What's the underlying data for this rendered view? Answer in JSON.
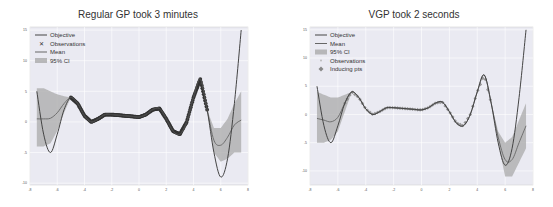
{
  "figure": {
    "left_title": "Regular GP took 3 minutes",
    "right_title": "VGP took 2 seconds"
  },
  "colors": {
    "background": "#eaeaf2",
    "grid": "#ffffff",
    "objective": "#444444",
    "mean": "#666666",
    "ci": "#aaaaaa",
    "observations": "#333333",
    "inducing": "#888888"
  },
  "chart_data": [
    {
      "type": "line",
      "title": "Regular GP took 3 minutes",
      "xlabel": "",
      "ylabel": "",
      "xlim": [
        -8,
        8
      ],
      "ylim": [
        -10,
        15
      ],
      "x_ticks": [
        "-8",
        "-6",
        "-4",
        "-2",
        "0",
        "2",
        "4",
        "6",
        "8"
      ],
      "y_ticks": [
        "15",
        "10",
        "5",
        "0",
        "-5",
        "-10"
      ],
      "grid": true,
      "legend_position": "upper left",
      "legend": [
        "Objective",
        "Observations",
        "Mean",
        "95% CI"
      ],
      "series": [
        {
          "name": "Objective",
          "x": [
            -7.5,
            -7,
            -6.5,
            -6,
            -5.5,
            -5,
            -4.5,
            -4,
            -3.5,
            -3,
            -2.5,
            -2,
            -1.5,
            -1,
            -0.5,
            0,
            0.5,
            1,
            1.5,
            2,
            2.5,
            3,
            3.5,
            4,
            4.5,
            5,
            5.5,
            6,
            6.5,
            7,
            7.5
          ],
          "values": [
            5,
            -2,
            -5,
            -2,
            2,
            4,
            3,
            1,
            0,
            0.5,
            1.2,
            1.2,
            1.1,
            1.0,
            0.9,
            0.8,
            1.2,
            2,
            2.2,
            0.5,
            -1.5,
            -2,
            0,
            4,
            7,
            2,
            -5,
            -9,
            -6,
            3,
            15
          ]
        },
        {
          "name": "Mean",
          "x": [
            -7.5,
            -7,
            -6.5,
            -6,
            -5.5,
            -5,
            -4.5,
            -4,
            -3.5,
            -3,
            -2.5,
            -2,
            -1.5,
            -1,
            -0.5,
            0,
            0.5,
            1,
            1.5,
            2,
            2.5,
            3,
            3.5,
            4,
            4.5,
            5,
            5.5,
            6,
            6.5,
            7,
            7.5
          ],
          "values": [
            0.5,
            0.5,
            0.6,
            1.5,
            3,
            4,
            3,
            1,
            0,
            0.5,
            1.2,
            1.2,
            1.1,
            1.0,
            0.9,
            0.8,
            1.2,
            2,
            2.2,
            0.5,
            -1.5,
            -2,
            0,
            4,
            7,
            2,
            -3,
            -3.8,
            -2.5,
            -0.5,
            0.3
          ]
        },
        {
          "name": "95% CI upper",
          "x": [
            -7.5,
            -7,
            -6.5,
            -6,
            -5.5,
            -5,
            5,
            5.5,
            6,
            6.5,
            7,
            7.5
          ],
          "values": [
            5.5,
            5.5,
            5,
            4.5,
            4.2,
            4,
            2,
            -1,
            -1,
            0.5,
            3,
            5
          ]
        },
        {
          "name": "95% CI lower",
          "x": [
            -7.5,
            -7,
            -6.5,
            -6,
            -5.5,
            -5,
            5,
            5.5,
            6,
            6.5,
            7,
            7.5
          ],
          "values": [
            -4,
            -4,
            -3.5,
            -1.5,
            1.5,
            4,
            2,
            -5,
            -6.5,
            -6,
            -5,
            -5
          ]
        },
        {
          "name": "Observations",
          "x_range": [
            -5,
            5
          ],
          "note": "dense observations along objective"
        }
      ]
    },
    {
      "type": "line",
      "title": "VGP took 2 seconds",
      "xlabel": "",
      "ylabel": "",
      "xlim": [
        -8,
        8
      ],
      "ylim": [
        -12,
        15
      ],
      "x_ticks": [
        "-8",
        "-6",
        "-4",
        "-2",
        "0",
        "2",
        "4",
        "6",
        "8"
      ],
      "y_ticks": [
        "15",
        "10",
        "5",
        "0",
        "-5",
        "-10"
      ],
      "grid": true,
      "legend_position": "upper left",
      "legend": [
        "Objective",
        "Mean",
        "95% CI",
        "Observations",
        "Inducing pts"
      ],
      "series": [
        {
          "name": "Objective",
          "x": [
            -7.5,
            -7,
            -6.5,
            -6,
            -5.5,
            -5,
            -4.5,
            -4,
            -3.5,
            -3,
            -2.5,
            -2,
            -1.5,
            -1,
            -0.5,
            0,
            0.5,
            1,
            1.5,
            2,
            2.5,
            3,
            3.5,
            4,
            4.5,
            5,
            5.5,
            6,
            6.5,
            7,
            7.5
          ],
          "values": [
            5,
            -2,
            -5,
            -2,
            2,
            4,
            3,
            1,
            0,
            0.5,
            1.2,
            1.2,
            1.1,
            1.0,
            0.9,
            0.8,
            1.2,
            2,
            2.2,
            0.5,
            -1.5,
            -2,
            0,
            4,
            7,
            2,
            -5,
            -9,
            -6,
            3,
            15
          ]
        },
        {
          "name": "Mean",
          "x": [
            -7.5,
            -7,
            -6.5,
            -6,
            -5.5,
            -5,
            -4.5,
            -4,
            -3.5,
            -3,
            -2.5,
            -2,
            -1.5,
            -1,
            -0.5,
            0,
            0.5,
            1,
            1.5,
            2,
            2.5,
            3,
            3.5,
            4,
            4.5,
            5,
            5.5,
            6,
            6.5,
            7,
            7.5
          ],
          "values": [
            -0.7,
            -1,
            -1.3,
            -0.5,
            2,
            4,
            3,
            1,
            0,
            0.5,
            1.2,
            1.2,
            1.1,
            1.0,
            0.9,
            0.8,
            1.2,
            2,
            2.2,
            0.5,
            -1.5,
            -2,
            0,
            4,
            7,
            2,
            -4,
            -8,
            -8,
            -5,
            -2
          ]
        },
        {
          "name": "95% CI upper",
          "x": [
            -7.5,
            -7,
            -6.5,
            -6,
            -5.5,
            -5,
            5,
            5.5,
            6,
            6.5,
            7,
            7.5
          ],
          "values": [
            4,
            3.5,
            3,
            3,
            3.5,
            4,
            2,
            -3,
            -5,
            -4,
            -1,
            2
          ]
        },
        {
          "name": "95% CI lower",
          "x": [
            -7.5,
            -7,
            -6.5,
            -6,
            -5.5,
            -5,
            5,
            5.5,
            6,
            6.5,
            7,
            7.5
          ],
          "values": [
            -5,
            -5,
            -4.5,
            -3,
            0.5,
            4,
            2,
            -5,
            -11,
            -11,
            -8.5,
            -6
          ]
        },
        {
          "name": "Inducing pts",
          "x_range": [
            -5.5,
            5
          ],
          "note": "inducing points along objective"
        }
      ]
    }
  ]
}
